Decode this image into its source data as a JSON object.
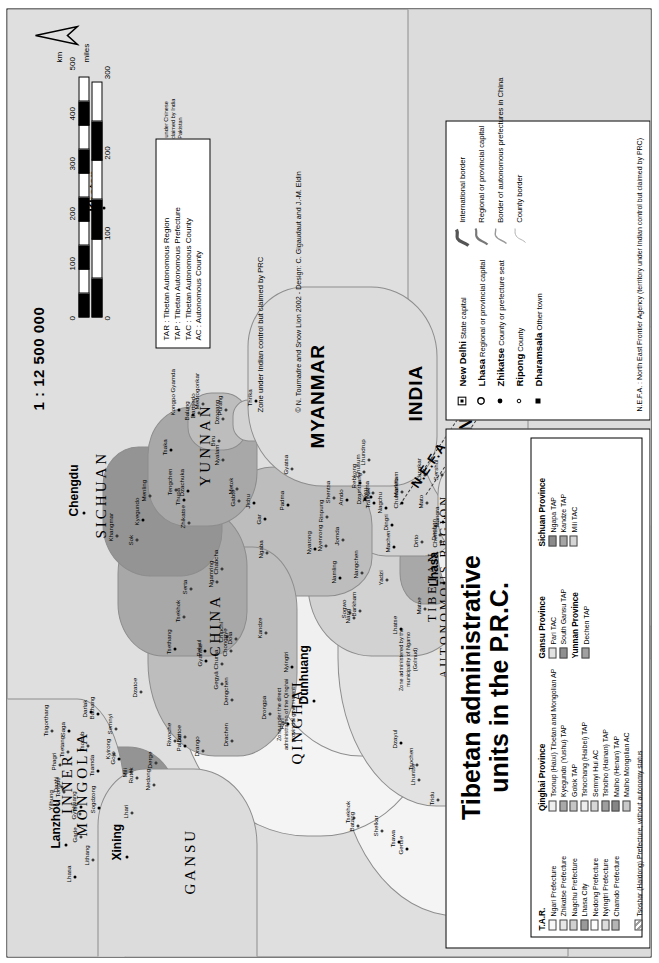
{
  "title": {
    "line1": "Tibetan administrative",
    "line2": "units in the P.R.C."
  },
  "scale": {
    "ratio": "1 : 12 500 000",
    "unit_km": "km",
    "unit_miles": "miles",
    "km_ticks": [
      "0",
      "100",
      "200",
      "300",
      "400",
      "500"
    ],
    "mile_ticks": [
      "0",
      "100",
      "200",
      "300"
    ]
  },
  "abbreviations": [
    {
      "code": "TAR",
      "meaning": "Tibetan Autonomous Region"
    },
    {
      "code": "TAP",
      "meaning": "Tibetan Autonomous Prefecture"
    },
    {
      "code": "TAC",
      "meaning": "Tibetan Autonomous County"
    },
    {
      "code": "AC",
      "meaning": "Autonomous County"
    }
  ],
  "claim_note": "Zone under Indian control but claimed by PRC",
  "credit": "© N. Tournadre and Snow Lion 2002 - Design: C. Gigaudaut and J.-M. Eldin",
  "symbol_legend": {
    "places": [
      {
        "icon": "state-capital-icon",
        "example": "New Delhi",
        "label": "State capital"
      },
      {
        "icon": "regional-capital-icon",
        "example": "Lhasa",
        "label": "Regional or provincial capital"
      },
      {
        "icon": "prefecture-seat-icon",
        "example": "Zhikatse",
        "label": "County or prefecture seat"
      },
      {
        "icon": "county-icon",
        "example": "Ripong",
        "label": "County"
      },
      {
        "icon": "other-town-icon",
        "example": "Dharamsala",
        "label": "Other town"
      }
    ],
    "lines": [
      {
        "icon": "international-border-icon",
        "label": "International border"
      },
      {
        "icon": "regional-border-icon",
        "label": "Regional or provincial capital"
      },
      {
        "icon": "autonomous-prefecture-border-icon",
        "label": "Border of autonomous prefectures in China"
      },
      {
        "icon": "county-border-icon",
        "label": "County border"
      }
    ],
    "nefa": "N.E.F.A. : North East Frontier Agency (territory under Indian control but claimed by PRC)"
  },
  "legend": {
    "groups": [
      {
        "header": "T.A.R.",
        "items": [
          {
            "label": "Ngari Prefecture",
            "color": "#f8f8f8"
          },
          {
            "label": "Zhikatse Prefecture",
            "color": "#e7e7e7"
          },
          {
            "label": "Nagchu Prefecture",
            "color": "#cfcfcf"
          },
          {
            "label": "Lhasa City",
            "color": "#9a9a9a"
          },
          {
            "label": "Nedong Prefecture",
            "color": "#fdfdfd"
          },
          {
            "label": "Nyingtri Prefecture",
            "color": "#dcdcdc"
          },
          {
            "label": "Chamdo Prefecture",
            "color": "#b4b4b4"
          }
        ]
      },
      {
        "header": "Qinghai Province",
        "items": [
          {
            "label": "Tsonup (Haixi) Tibetan and Mongolian AP",
            "color": "#efefef"
          },
          {
            "label": "Kyegundo (Yushu) TAP",
            "color": "#a9a9a9"
          },
          {
            "label": "Golok TAP",
            "color": "#c6c6c6"
          },
          {
            "label": "Tshochang (Haibei) TAP",
            "color": "#ededed"
          },
          {
            "label": "Semnyi Hui AC",
            "color": "#d7d7d7"
          },
          {
            "label": "Tsholho (Hainan) TAP",
            "color": "#9e9e9e"
          },
          {
            "label": "Malho (Henan) TAP",
            "color": "#858585"
          },
          {
            "label": "Malho Mongolian AC",
            "color": "#c9c9c9"
          }
        ]
      },
      {
        "header": "Gansu Province",
        "items": [
          {
            "label": "Pari TAC",
            "color": "#e2e2e2"
          },
          {
            "label": "South Gansu TAP",
            "color": "#8f8f8f"
          }
        ]
      },
      {
        "header": "Yunnan Province",
        "items": [
          {
            "label": "Dechen TAP",
            "color": "#a0a0a0"
          }
        ]
      },
      {
        "header": "Sichuan Province",
        "items": [
          {
            "label": "Ngapa TAP",
            "color": "#8b8b8b"
          },
          {
            "label": "Kandze TAP",
            "color": "#a5a5a5"
          },
          {
            "label": "Mili TAC",
            "color": "#d5d5d5"
          }
        ]
      }
    ],
    "footnote": {
      "label": "Tsoshar (Haidong) Prefecture, without autonomy status",
      "pattern": "hatched"
    }
  },
  "map": {
    "countries": [
      {
        "name": "INNER\nMONGOLIA",
        "x": 120,
        "y": 52
      },
      {
        "name": "GANSU",
        "x": 62,
        "y": 175
      },
      {
        "name": "QINGHAI",
        "x": 192,
        "y": 282
      },
      {
        "name": "CHINA",
        "x": 300,
        "y": 200
      },
      {
        "name": "SICHUAN",
        "x": 418,
        "y": 86
      },
      {
        "name": "YUNNAN",
        "x": 470,
        "y": 190
      },
      {
        "name": "MYANMAR",
        "x": 508,
        "y": 300
      },
      {
        "name": "INDIA",
        "x": 535,
        "y": 398
      },
      {
        "name": "BHUTAN",
        "x": 455,
        "y": 448
      },
      {
        "name": "BANGLADESH",
        "x": 540,
        "y": 470
      },
      {
        "name": "NEPAL",
        "x": 368,
        "y": 585
      },
      {
        "name": "PAKISTAN",
        "x": 60,
        "y": 806
      },
      {
        "name": "CHINESE TURKESTAN\n(Xinjiang)",
        "x": 120,
        "y": 560
      },
      {
        "name": "TIBETAN\nAUTONOMOUS REGION",
        "x": 278,
        "y": 418
      }
    ],
    "major_cities": [
      {
        "name": "Lanzhou",
        "x": 108,
        "y": 42
      },
      {
        "name": "Xining",
        "x": 96,
        "y": 103
      },
      {
        "name": "Chengdu",
        "x": 440,
        "y": 60
      },
      {
        "name": "Lhasa",
        "x": 370,
        "y": 420
      },
      {
        "name": "Thimbu",
        "x": 432,
        "y": 452
      },
      {
        "name": "Kathmandu",
        "x": 430,
        "y": 655
      },
      {
        "name": "New Delhi",
        "x": 880,
        "y": 860
      },
      {
        "name": "Dharamsala",
        "x": 845,
        "y": 745
      },
      {
        "name": "Khotan",
        "x": 745,
        "y": 80
      },
      {
        "name": "Dunhuang",
        "x": 252,
        "y": 290
      }
    ],
    "towns": [
      "Tso",
      "Dzitoe",
      "Chuma",
      "Jichu",
      "Yadzi",
      "Sogwo",
      "Rebkong",
      "Tsekhok",
      "Chentsa",
      "Thrika",
      "Dazhi",
      "Semnyi",
      "Pari",
      "Dola",
      "Chabcha",
      "Mangra",
      "Tsigorthang",
      "Khaipazomto",
      "Machen",
      "Gabte",
      "Gade",
      "Darlak",
      "Chipchi",
      "Tsekhok",
      "Padma",
      "Jikdril",
      "Matoe",
      "Tsaidam",
      "Mato",
      "Tengchen",
      "Sogdzong",
      "Tsonub",
      "Dzatoe",
      "Kyegundo",
      "Nangchen",
      "Drito",
      "Chumarleb",
      "Tridu",
      "Sershul",
      "Dzachuka",
      "Yilhung",
      "Derge",
      "Pelyul",
      "Serta",
      "Ngaba",
      "Dzamthang",
      "Barkham",
      "Trochu",
      "Tawu",
      "Dartsedo",
      "Lithang",
      "Bathang",
      "Drango",
      "Kandze",
      "Nyarong",
      "Chamdo",
      "Pashoe",
      "Tsawa",
      "Markham",
      "Dzogang",
      "Gojo",
      "Riwoche",
      "Dengchen",
      "Thupa",
      "Jomda",
      "Gonjo",
      "Dzayul",
      "Batang",
      "Dechen",
      "Balung",
      "Gyelthang",
      "Mili",
      "Nyingtri",
      "Menling",
      "Metok",
      "Tramok",
      "Lhorong",
      "Pashoe",
      "Nagchu",
      "Biru",
      "Lhari",
      "Palbar",
      "Drachen",
      "Sok",
      "Amdo",
      "Nyenrong",
      "Nagchu",
      "Damzhong",
      "Lhundrup",
      "Medrogonkar",
      "Lhasa",
      "Nedong",
      "Chonggye",
      "Tsethang",
      "Gyatsa",
      "Nang",
      "Tsona",
      "Lhuntse",
      "Chusum",
      "Kongpo Gyamda",
      "Tsetang",
      "Phagri",
      "Gyantse",
      "Khangmar",
      "Ngamring",
      "Lhatse",
      "Sakya",
      "Shelkar",
      "Dingri",
      "Nyalam",
      "Kyirong",
      "Saga",
      "Drongpa",
      "Zhikatse",
      "Namling",
      "Rinpung",
      "Tsochen",
      "Gertse",
      "Lungkar",
      "Purang",
      "Tsamda",
      "Rutok",
      "Gegyä",
      "Gar",
      "Shentsa",
      "Nyima",
      "Palgön",
      "Shakstse",
      "Siling",
      "Tsaka",
      "Tongde",
      "Tsigorthang"
    ],
    "notes": [
      {
        "text": "Zone under the direct administration of the Qinghai provincial government",
        "x": 205,
        "y": 268
      },
      {
        "text": "Zone administered by the municipality of Ngamo (Golmud)",
        "x": 260,
        "y": 390
      },
      {
        "text": "Aksai Chin under Chinese control and claimed by India and Pakistan",
        "x": 786,
        "y": 155
      }
    ],
    "nefa_label": "N.E.F.A."
  }
}
